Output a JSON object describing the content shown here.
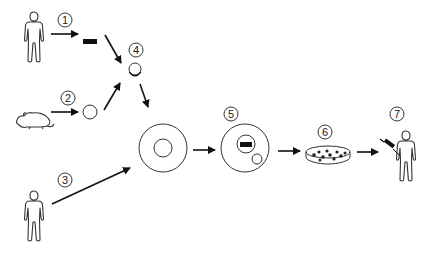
{
  "diagram": {
    "type": "process-flow",
    "steps": [
      {
        "id": 1,
        "label": "1",
        "source": "human-donor",
        "product": "black-bar-dna-fragment"
      },
      {
        "id": 2,
        "label": "2",
        "source": "mouse",
        "product": "small-cell"
      },
      {
        "id": 3,
        "label": "3",
        "source": "human-donor",
        "product": "large-cell"
      },
      {
        "id": 4,
        "label": "4",
        "product": "combined-small-cell"
      },
      {
        "id": 5,
        "label": "5",
        "product": "modified-cell-with-nucleus-and-vesicle"
      },
      {
        "id": 6,
        "label": "6",
        "product": "petri-dish-culture"
      },
      {
        "id": 7,
        "label": "7",
        "product": "injected-patient"
      }
    ],
    "colors": {
      "stroke": "#333333",
      "arrow": "#111111",
      "fill_dark": "#111111",
      "background": "#ffffff"
    }
  }
}
